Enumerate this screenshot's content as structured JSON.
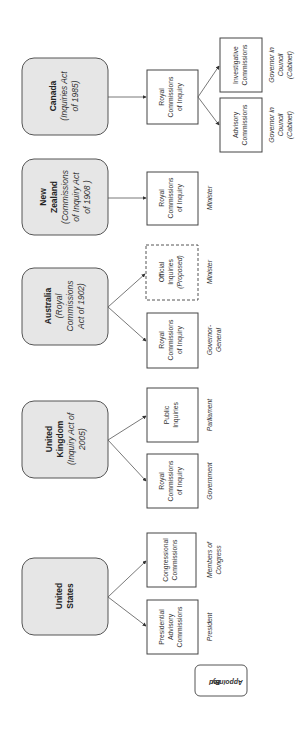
{
  "diagram": {
    "orientation": "rotated-90-ccw",
    "legend": {
      "line1": "Appointed",
      "line2": "By"
    },
    "countries": [
      {
        "name": "Canada",
        "act_lines": [
          "(Inquiries Act",
          "of 1985)"
        ],
        "children": [
          {
            "lines": [
              "Royal",
              "Commissions",
              "of Inquiry"
            ],
            "appointed_by": []
          }
        ],
        "sub_children": [
          {
            "lines": [
              "Investigative",
              "Commissions"
            ],
            "appointed_by": [
              "Governor in",
              "Council",
              "(Cabinet)"
            ]
          },
          {
            "lines": [
              "Advisory",
              "Commissions"
            ],
            "appointed_by": [
              "Governor in",
              "Council",
              "(Cabinet)"
            ]
          }
        ]
      },
      {
        "name_lines": [
          "New",
          "Zealand"
        ],
        "act_lines": [
          "(Commissions",
          "of Inquiry Act",
          "of 1908 )"
        ],
        "children": [
          {
            "lines": [
              "Royal",
              "Commissions",
              "of Inquiry"
            ],
            "appointed_by": [
              "Minister"
            ]
          }
        ]
      },
      {
        "name": "Australia",
        "act_lines": [
          "(Royal",
          "Commissions",
          "Act of 1902)"
        ],
        "children": [
          {
            "lines": [
              "Official",
              "Inquiries",
              "(Proposed)"
            ],
            "style": "dashed",
            "appointed_by": [
              "Minister"
            ]
          },
          {
            "lines": [
              "Royal",
              "Commissions",
              "of Inquiry"
            ],
            "appointed_by": [
              "Governor-",
              "General"
            ]
          }
        ]
      },
      {
        "name_lines": [
          "United",
          "Kingdom"
        ],
        "act_lines": [
          "(Inquiry Act of",
          "2005)"
        ],
        "children": [
          {
            "lines": [
              "Public",
              "Inquiries"
            ],
            "appointed_by": [
              "Parliament"
            ]
          },
          {
            "lines": [
              "Royal",
              "Commissions",
              "of Inquiry"
            ],
            "appointed_by": [
              "Government"
            ]
          }
        ]
      },
      {
        "name_lines": [
          "United",
          "States"
        ],
        "act_lines": [],
        "children": [
          {
            "lines": [
              "Congressional",
              "Commissions"
            ],
            "appointed_by": [
              "Members of",
              "Congress"
            ]
          },
          {
            "lines": [
              "Presidential",
              "Advisory",
              "Commissions"
            ],
            "appointed_by": [
              "President"
            ]
          }
        ]
      }
    ]
  }
}
